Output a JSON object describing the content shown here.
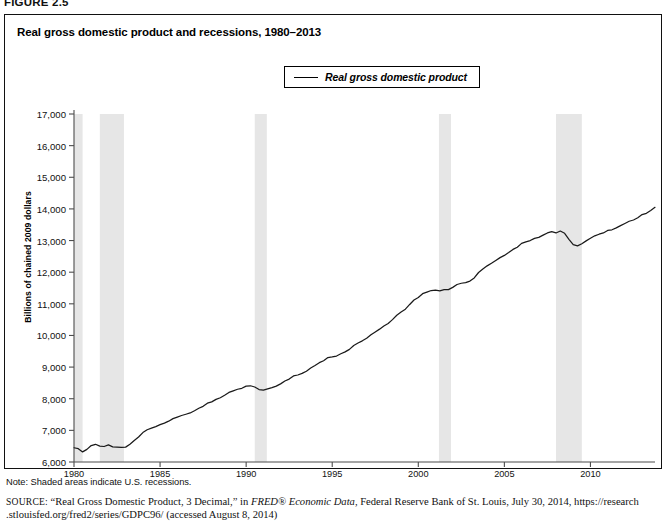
{
  "figure": {
    "number_label": "FIGURE 2.5",
    "title": "Real gross domestic product and recessions, 1980–2013"
  },
  "legend": {
    "position": "top-center",
    "entries": [
      {
        "label": "Real gross domestic product",
        "color": "#1a1a1a",
        "marker": "line"
      }
    ]
  },
  "notes": {
    "note": "Note: Shaded areas indicate U.S. recessions.",
    "source_label": "SOURCE:",
    "source_part1": "“Real Gross Domestic Product, 3 Decimal,” in ",
    "source_italic": "FRED® Economic Data",
    "source_part2": ", Federal Reserve Bank of St. Louis, July 30, 2014, https://research",
    "source_line2": ".stlouisfed.org/fred2/series/GDPC96/ (accessed August 8, 2014)"
  },
  "chart_data": {
    "type": "line",
    "title": "Real gross domestic product and recessions, 1980–2013",
    "xlabel": "",
    "ylabel": "Billions of chained 2009 dollars",
    "xlim": [
      1980,
      2013.75
    ],
    "ylim": [
      6000,
      17000
    ],
    "ytick_step": 1000,
    "grid": false,
    "legend_position": "top-center",
    "yticks": [
      6000,
      7000,
      8000,
      9000,
      10000,
      11000,
      12000,
      13000,
      14000,
      15000,
      16000,
      17000
    ],
    "ytick_labels": [
      "6,000",
      "7,000",
      "8,000",
      "9,000",
      "10,000",
      "11,000",
      "12,000",
      "13,000",
      "14,000",
      "15,000",
      "16,000",
      "17,000"
    ],
    "xticks": [
      1980,
      1985,
      1990,
      1995,
      2000,
      2005,
      2010
    ],
    "xtick_labels": [
      "1980",
      "1985",
      "1990",
      "1995",
      "2000",
      "2005",
      "2010"
    ],
    "line_color": "#1a1a1a",
    "shaded_color": "#e6e6e6",
    "shaded_regions": [
      {
        "label": "1980 recession",
        "start": 1980.0,
        "end": 1980.5
      },
      {
        "label": "1981–82 recession",
        "start": 1981.5,
        "end": 1982.9
      },
      {
        "label": "1990–91 recession",
        "start": 1990.5,
        "end": 1991.2
      },
      {
        "label": "2001 recession",
        "start": 2001.2,
        "end": 2001.9
      },
      {
        "label": "2007–09 recession",
        "start": 2008.0,
        "end": 2009.5
      }
    ],
    "series": [
      {
        "name": "Real gross domestic product",
        "x": [
          1980.0,
          1980.25,
          1980.5,
          1980.75,
          1981.0,
          1981.25,
          1981.5,
          1981.75,
          1982.0,
          1982.25,
          1982.5,
          1982.75,
          1983.0,
          1983.25,
          1983.5,
          1983.75,
          1984.0,
          1984.25,
          1984.5,
          1984.75,
          1985.0,
          1985.25,
          1985.5,
          1985.75,
          1986.0,
          1986.25,
          1986.5,
          1986.75,
          1987.0,
          1987.25,
          1987.5,
          1987.75,
          1988.0,
          1988.25,
          1988.5,
          1988.75,
          1989.0,
          1989.25,
          1989.5,
          1989.75,
          1990.0,
          1990.25,
          1990.5,
          1990.75,
          1991.0,
          1991.25,
          1991.5,
          1991.75,
          1992.0,
          1992.25,
          1992.5,
          1992.75,
          1993.0,
          1993.25,
          1993.5,
          1993.75,
          1994.0,
          1994.25,
          1994.5,
          1994.75,
          1995.0,
          1995.25,
          1995.5,
          1995.75,
          1996.0,
          1996.25,
          1996.5,
          1996.75,
          1997.0,
          1997.25,
          1997.5,
          1997.75,
          1998.0,
          1998.25,
          1998.5,
          1998.75,
          1999.0,
          1999.25,
          1999.5,
          1999.75,
          2000.0,
          2000.25,
          2000.5,
          2000.75,
          2001.0,
          2001.25,
          2001.5,
          2001.75,
          2002.0,
          2002.25,
          2002.5,
          2002.75,
          2003.0,
          2003.25,
          2003.5,
          2003.75,
          2004.0,
          2004.25,
          2004.5,
          2004.75,
          2005.0,
          2005.25,
          2005.5,
          2005.75,
          2006.0,
          2006.25,
          2006.5,
          2006.75,
          2007.0,
          2007.25,
          2007.5,
          2007.75,
          2008.0,
          2008.25,
          2008.5,
          2008.75,
          2009.0,
          2009.25,
          2009.5,
          2009.75,
          2010.0,
          2010.25,
          2010.5,
          2010.75,
          2011.0,
          2011.25,
          2011.5,
          2011.75,
          2012.0,
          2012.25,
          2012.5,
          2012.75,
          2013.0,
          2013.25,
          2013.5,
          2013.75
        ],
        "y": [
          6450,
          6420,
          6320,
          6400,
          6520,
          6560,
          6500,
          6490,
          6540,
          6480,
          6470,
          6460,
          6470,
          6560,
          6680,
          6790,
          6930,
          7020,
          7070,
          7120,
          7180,
          7230,
          7290,
          7370,
          7420,
          7470,
          7510,
          7550,
          7620,
          7700,
          7760,
          7860,
          7900,
          7980,
          8030,
          8110,
          8200,
          8250,
          8300,
          8330,
          8400,
          8410,
          8370,
          8290,
          8270,
          8310,
          8350,
          8400,
          8470,
          8560,
          8620,
          8720,
          8750,
          8800,
          8870,
          8970,
          9050,
          9140,
          9200,
          9300,
          9320,
          9350,
          9420,
          9480,
          9560,
          9680,
          9760,
          9830,
          9910,
          10020,
          10110,
          10200,
          10300,
          10380,
          10500,
          10640,
          10740,
          10830,
          10980,
          11120,
          11200,
          11320,
          11370,
          11420,
          11430,
          11410,
          11450,
          11450,
          11520,
          11610,
          11650,
          11670,
          11720,
          11820,
          11990,
          12100,
          12200,
          12280,
          12370,
          12460,
          12530,
          12620,
          12720,
          12790,
          12910,
          12960,
          13000,
          13070,
          13100,
          13170,
          13240,
          13280,
          13240,
          13300,
          13230,
          13040,
          12870,
          12830,
          12900,
          12990,
          13070,
          13150,
          13200,
          13240,
          13320,
          13340,
          13400,
          13470,
          13540,
          13610,
          13650,
          13720,
          13820,
          13860,
          13950,
          14050
        ]
      }
    ]
  }
}
